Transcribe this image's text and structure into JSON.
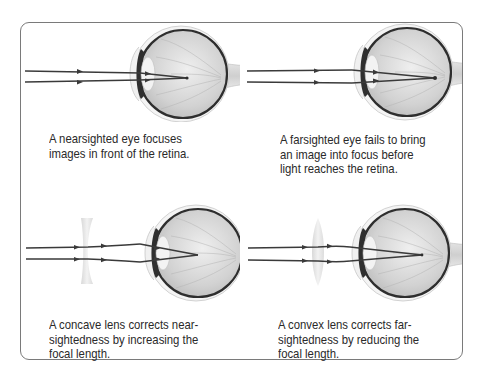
{
  "diagram": {
    "panels": [
      {
        "id": "nearsighted",
        "lens": "none",
        "caption_lines": [
          "A nearsighted eye focuses",
          "images in front of the retina."
        ]
      },
      {
        "id": "farsighted",
        "lens": "none",
        "caption_lines": [
          "A farsighted eye fails to bring",
          "an image into focus before",
          "light reaches the retina."
        ]
      },
      {
        "id": "concave-correction",
        "lens": "concave",
        "caption_lines": [
          "A concave lens corrects near-",
          "sightedness by increasing the",
          "focal length."
        ]
      },
      {
        "id": "convex-correction",
        "lens": "convex",
        "caption_lines": [
          "A convex lens corrects far-",
          "sightedness by reducing the",
          "focal length."
        ]
      }
    ],
    "colors": {
      "frame_border": "#7a7a7a",
      "ray": "#3a3a3a",
      "eye_fill": "#d9d9d9",
      "eye_wall": "#2e2e2e",
      "lens": "#e6e6e6",
      "caption_text": "#2a2a2a"
    }
  }
}
